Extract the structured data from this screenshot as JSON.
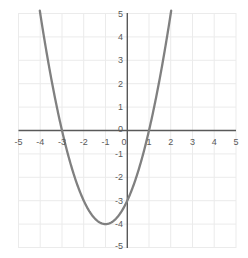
{
  "chart_data": {
    "type": "line",
    "title": "",
    "subtitle": "",
    "xlabel": "",
    "ylabel": "",
    "xlim": [
      -5,
      5
    ],
    "ylim": [
      -5,
      5
    ],
    "grid": true,
    "legend": "none",
    "function": "y = x^2 + 2x - 3",
    "series": [
      {
        "name": "parabola",
        "color": "#808080",
        "x": [
          -3.2,
          -3.0,
          -2.75,
          -2.5,
          -2.25,
          -2.0,
          -1.75,
          -1.5,
          -1.25,
          -1.0,
          -0.75,
          -0.5,
          -0.25,
          0.0,
          0.25,
          0.5,
          0.75,
          1.0,
          1.25,
          1.5,
          1.75,
          2.0,
          2.2
        ],
        "values": [
          4.04,
          3.0,
          1.5625,
          0.25,
          -0.9375,
          -2.0,
          -2.9375,
          -3.75,
          -4.4375,
          -4.0,
          -3.9375,
          -3.75,
          -3.4375,
          -3.0,
          -2.4375,
          -1.75,
          -0.9375,
          0.0,
          1.0625,
          2.25,
          3.5625,
          5.0,
          6.24
        ]
      }
    ],
    "annotations": {
      "vertex": [
        -1,
        -4
      ],
      "roots": [
        -3,
        1
      ],
      "y_intercept": -3
    },
    "x_ticks": [
      {
        "value": -5,
        "label": "-5"
      },
      {
        "value": -4,
        "label": "-4"
      },
      {
        "value": -3,
        "label": "-3"
      },
      {
        "value": -2,
        "label": "-2"
      },
      {
        "value": -1,
        "label": "-1"
      },
      {
        "value": 0,
        "label": "0"
      },
      {
        "value": 1,
        "label": "1"
      },
      {
        "value": 2,
        "label": "2"
      },
      {
        "value": 3,
        "label": "3"
      },
      {
        "value": 4,
        "label": "4"
      },
      {
        "value": 5,
        "label": "5"
      }
    ],
    "y_ticks": [
      {
        "value": 5,
        "label": "5"
      },
      {
        "value": 4,
        "label": "4"
      },
      {
        "value": 3,
        "label": "3"
      },
      {
        "value": 2,
        "label": "2"
      },
      {
        "value": 1,
        "label": "1"
      },
      {
        "value": 0,
        "label": "0"
      },
      {
        "value": -1,
        "label": "-1"
      },
      {
        "value": -2,
        "label": "-2"
      },
      {
        "value": -3,
        "label": "-3"
      },
      {
        "value": -4,
        "label": "-4"
      },
      {
        "value": -5,
        "label": "-5"
      }
    ],
    "colors": {
      "curve": "#808080",
      "axis": "#595959",
      "grid": "#ebebeb",
      "tick_text": "#595959",
      "background": "#ffffff"
    }
  }
}
